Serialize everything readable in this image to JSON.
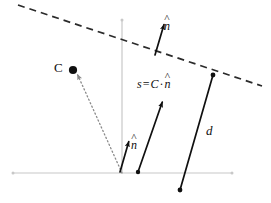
{
  "figure": {
    "background_color": "#ffffff",
    "width": 271,
    "height": 203
  },
  "colors": {
    "ink": "#101010",
    "axis": "#c8c8c8",
    "dashed_line": "#2b2b2b",
    "dotted_line": "#8a8a8a"
  },
  "labels": {
    "point_c": "C",
    "distance": "d",
    "normal_top": {
      "symbol": "n",
      "accent": "^"
    },
    "normal_bottom": {
      "symbol": "n",
      "accent": "^"
    },
    "s_equation": {
      "lhs": "s",
      "equals": "=",
      "rhs_vector": "C",
      "operator": "·",
      "rhs_normal": "n",
      "accent": "^",
      "plain": "s = C · n̂"
    }
  },
  "geometry": {
    "origin": {
      "x": 122,
      "y": 173
    },
    "x_axis": {
      "x1": 13,
      "y1": 173,
      "x2": 232,
      "y2": 173
    },
    "y_axis": {
      "x1": 122,
      "y1": 20,
      "x2": 122,
      "y2": 173
    },
    "plane_line": {
      "x1": 18,
      "y1": 5,
      "x2": 262,
      "y2": 86,
      "style": "dashed"
    },
    "c_point": {
      "x": 73,
      "y": 70
    },
    "c_ray": {
      "x1": 122,
      "y1": 173,
      "x2": 77,
      "y2": 74,
      "style": "dotted"
    },
    "normal_top_arrow": {
      "x1": 155,
      "y1": 55,
      "x2": 164,
      "y2": 23
    },
    "normal_bottom_arrow": {
      "x1": 120,
      "y1": 172,
      "x2": 129,
      "y2": 140
    },
    "s_arrow": {
      "x1": 138,
      "y1": 172,
      "x2": 163,
      "y2": 100
    },
    "s_tail_dot": {
      "x": 138,
      "y": 172
    },
    "d_segment": {
      "x1": 213,
      "y1": 75,
      "x2": 180,
      "y2": 190
    },
    "d_top_dot": {
      "x": 213,
      "y": 75
    },
    "d_bottom_dot": {
      "x": 180,
      "y": 190
    }
  }
}
